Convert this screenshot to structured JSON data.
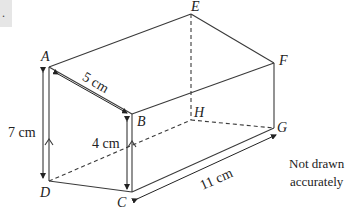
{
  "question": {
    "number_fragment": "."
  },
  "vertices": {
    "A": {
      "label": "A",
      "x": 49,
      "y": 67
    },
    "B": {
      "label": "B",
      "x": 132,
      "y": 114
    },
    "C": {
      "label": "C",
      "x": 132,
      "y": 192
    },
    "D": {
      "label": "D",
      "x": 49,
      "y": 181
    },
    "E": {
      "label": "E",
      "x": 191,
      "y": 14
    },
    "F": {
      "label": "F",
      "x": 274,
      "y": 63
    },
    "G": {
      "label": "G",
      "x": 274,
      "y": 128
    },
    "H": {
      "label": "H",
      "x": 191,
      "y": 120
    }
  },
  "dimensions": {
    "AB": "5 cm",
    "AD": "7 cm",
    "BC": "4 cm",
    "CG": "11 cm"
  },
  "note": {
    "line1": "Not drawn",
    "line2": "accurately"
  },
  "colors": {
    "line": "#3a3a3a",
    "label": "#222222",
    "box": "#e6e6e6"
  }
}
